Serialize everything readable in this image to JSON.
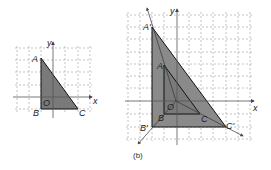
{
  "figure": {
    "caption_right": "(b)",
    "colors": {
      "grid": "#9a9a9a",
      "axis": "#555555",
      "triangle_fill": "#7a7a7a",
      "triangle_stroke": "#111111",
      "image_fill": "#8a8a8a",
      "label": "#222222"
    }
  },
  "left_panel": {
    "axis_labels": {
      "x": "x",
      "y": "y"
    },
    "origin_label": "O",
    "vertices": [
      {
        "name": "A",
        "label": "A"
      },
      {
        "name": "B",
        "label": "B"
      },
      {
        "name": "C",
        "label": "C"
      }
    ]
  },
  "right_panel": {
    "axis_labels": {
      "x": "x",
      "y": "y"
    },
    "origin_label": "O",
    "original_vertices": [
      {
        "name": "A",
        "label": "A"
      },
      {
        "name": "B",
        "label": "B"
      },
      {
        "name": "C",
        "label": "C"
      }
    ],
    "image_vertices": [
      {
        "name": "A'",
        "label": "A'"
      },
      {
        "name": "B'",
        "label": "B'"
      },
      {
        "name": "C'",
        "label": "C'"
      }
    ],
    "caption": "(b)"
  }
}
